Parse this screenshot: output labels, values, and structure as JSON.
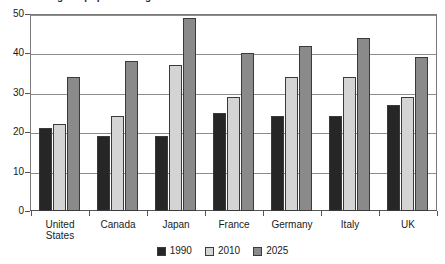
{
  "chart_data": {
    "type": "bar",
    "title": "Percentage of population aged 65 and over",
    "xlabel": "",
    "ylabel": "",
    "ylim": [
      0,
      50
    ],
    "yticks": [
      0,
      10,
      20,
      30,
      40,
      50
    ],
    "ytick_labels": [
      "0",
      "10",
      "20",
      "30",
      "40",
      "50"
    ],
    "grid": true,
    "legend_position": "bottom",
    "categories": [
      "United States",
      "Canada",
      "Japan",
      "France",
      "Germany",
      "Italy",
      "UK"
    ],
    "category_lines": [
      [
        "United",
        "States"
      ],
      [
        "Canada"
      ],
      [
        "Japan"
      ],
      [
        "France"
      ],
      [
        "Germany"
      ],
      [
        "Italy"
      ],
      [
        "UK"
      ]
    ],
    "series": [
      {
        "name": "1990",
        "color": "#262626",
        "values": [
          21,
          19,
          19,
          25,
          24,
          24,
          27
        ]
      },
      {
        "name": "2010",
        "color": "#d4d4d4",
        "values": [
          22,
          24,
          37,
          29,
          34,
          34,
          29
        ]
      },
      {
        "name": "2025",
        "color": "#8a8a8a",
        "values": [
          34,
          38,
          49,
          40,
          42,
          44,
          39
        ]
      }
    ]
  },
  "axis": {
    "grid_color": "#8c8c8c",
    "axis_color": "#555555"
  }
}
